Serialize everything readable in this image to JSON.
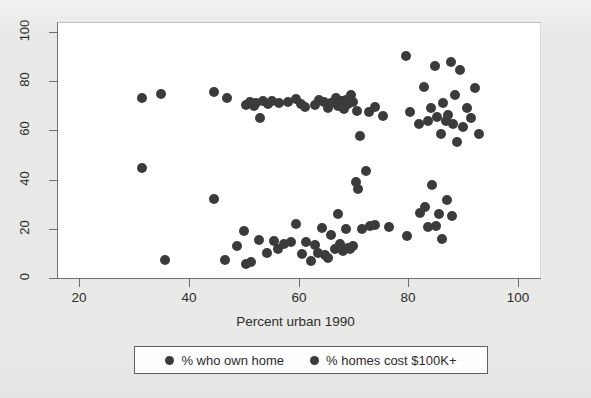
{
  "chart_data": {
    "type": "scatter",
    "title": "",
    "xlabel": "Percent urban 1990",
    "ylabel": "",
    "xlim": [
      16,
      104
    ],
    "ylim": [
      0,
      104
    ],
    "xticks": [
      20,
      40,
      60,
      80,
      100
    ],
    "yticks": [
      0,
      20,
      40,
      60,
      80,
      100
    ],
    "grid": false,
    "legend_position": "bottom",
    "series": [
      {
        "name": "% who own home",
        "color": "#3b3b3b",
        "points": [
          [
            31.4,
            73.0
          ],
          [
            34.9,
            74.6
          ],
          [
            44.6,
            75.6
          ],
          [
            47.0,
            73.0
          ],
          [
            50.5,
            70.5
          ],
          [
            51.2,
            71.5
          ],
          [
            51.9,
            69.8
          ],
          [
            52.3,
            71.2
          ],
          [
            52.9,
            65.0
          ],
          [
            53.6,
            71.8
          ],
          [
            54.4,
            70.6
          ],
          [
            55.1,
            71.9
          ],
          [
            56.5,
            71.0
          ],
          [
            58.0,
            71.5
          ],
          [
            59.6,
            72.6
          ],
          [
            60.4,
            70.8
          ],
          [
            61.2,
            69.5
          ],
          [
            63.0,
            70.3
          ],
          [
            63.8,
            72.2
          ],
          [
            64.6,
            71.5
          ],
          [
            65.3,
            69.2
          ],
          [
            66.0,
            71.0
          ],
          [
            66.8,
            73.0
          ],
          [
            67.2,
            70.0
          ],
          [
            67.8,
            71.8
          ],
          [
            68.2,
            68.6
          ],
          [
            68.6,
            72.4
          ],
          [
            69.1,
            70.9
          ],
          [
            69.5,
            74.3
          ],
          [
            70.0,
            71.6
          ],
          [
            70.6,
            68.0
          ],
          [
            71.2,
            57.8
          ],
          [
            72.8,
            67.5
          ],
          [
            74.0,
            69.4
          ],
          [
            75.4,
            65.8
          ],
          [
            79.5,
            90.2
          ],
          [
            80.3,
            67.6
          ],
          [
            82.0,
            62.5
          ],
          [
            82.8,
            77.6
          ],
          [
            83.5,
            64.0
          ],
          [
            84.2,
            69.0
          ],
          [
            84.8,
            86.2
          ],
          [
            85.3,
            65.3
          ],
          [
            85.9,
            58.4
          ],
          [
            86.4,
            71.0
          ],
          [
            86.9,
            63.8
          ],
          [
            87.3,
            66.4
          ],
          [
            87.7,
            87.8
          ],
          [
            88.1,
            62.6
          ],
          [
            88.5,
            74.4
          ],
          [
            88.9,
            55.4
          ],
          [
            89.4,
            84.6
          ],
          [
            90.0,
            61.5
          ],
          [
            90.7,
            69.2
          ],
          [
            91.4,
            65.0
          ],
          [
            92.1,
            77.4
          ],
          [
            92.8,
            58.6
          ]
        ]
      },
      {
        "name": "% homes cost $100K+",
        "color": "#3b3b3b",
        "points": [
          [
            31.4,
            44.6
          ],
          [
            35.6,
            7.2
          ],
          [
            44.6,
            32.0
          ],
          [
            46.6,
            7.4
          ],
          [
            48.8,
            13.0
          ],
          [
            50.0,
            19.0
          ],
          [
            50.4,
            5.6
          ],
          [
            51.4,
            6.4
          ],
          [
            52.8,
            15.4
          ],
          [
            54.3,
            10.2
          ],
          [
            55.5,
            15.2
          ],
          [
            56.3,
            11.8
          ],
          [
            57.3,
            13.8
          ],
          [
            58.6,
            14.8
          ],
          [
            59.5,
            22.0
          ],
          [
            60.6,
            9.6
          ],
          [
            61.3,
            14.8
          ],
          [
            62.2,
            6.8
          ],
          [
            63.0,
            13.4
          ],
          [
            63.6,
            10.0
          ],
          [
            64.3,
            20.4
          ],
          [
            64.9,
            9.4
          ],
          [
            65.4,
            8.2
          ],
          [
            66.0,
            17.6
          ],
          [
            66.6,
            11.6
          ],
          [
            67.1,
            26.0
          ],
          [
            67.6,
            14.0
          ],
          [
            68.1,
            10.8
          ],
          [
            68.6,
            20.0
          ],
          [
            69.0,
            12.4
          ],
          [
            69.4,
            12.0
          ],
          [
            69.9,
            13.0
          ],
          [
            70.4,
            39.0
          ],
          [
            70.9,
            36.0
          ],
          [
            71.5,
            19.8
          ],
          [
            72.2,
            43.4
          ],
          [
            73.0,
            21.2
          ],
          [
            74.0,
            21.4
          ],
          [
            76.5,
            20.8
          ],
          [
            79.8,
            17.0
          ],
          [
            82.2,
            26.4
          ],
          [
            83.0,
            29.0
          ],
          [
            83.6,
            20.8
          ],
          [
            84.3,
            38.0
          ],
          [
            85.0,
            21.0
          ],
          [
            85.6,
            26.2
          ],
          [
            86.2,
            16.0
          ],
          [
            87.0,
            31.8
          ],
          [
            88.0,
            25.2
          ]
        ]
      }
    ]
  },
  "axis": {
    "x_tick_labels": [
      "20",
      "40",
      "60",
      "80",
      "100"
    ],
    "y_tick_labels": [
      "0",
      "20",
      "40",
      "60",
      "80",
      "100"
    ],
    "x_title": "Percent urban 1990"
  },
  "legend": {
    "entries": [
      {
        "label": "% who own home",
        "marker": "filled-circle-marker"
      },
      {
        "label": "% homes cost $100K+",
        "marker": "filled-circle-marker"
      }
    ]
  }
}
